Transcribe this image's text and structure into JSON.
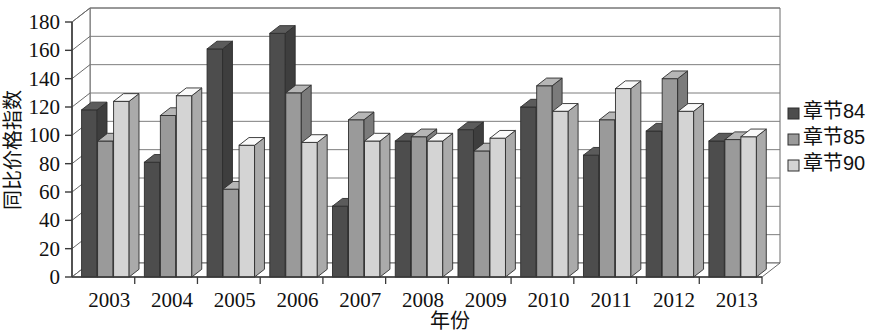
{
  "chart_data": {
    "type": "bar",
    "title": "",
    "subtitle": "",
    "xlabel": "年份",
    "ylabel": "同比价格指数",
    "categories": [
      "2003",
      "2004",
      "2005",
      "2006",
      "2007",
      "2008",
      "2009",
      "2010",
      "2011",
      "2012",
      "2013"
    ],
    "series": [
      {
        "name": "章节84",
        "color": "#4d4d4d",
        "values": [
          118,
          81,
          161,
          172,
          50,
          96,
          104,
          120,
          86,
          103,
          96
        ]
      },
      {
        "name": "章节85",
        "color": "#9a9a9a",
        "values": [
          96,
          114,
          62,
          130,
          111,
          99,
          89,
          135,
          111,
          140,
          97
        ]
      },
      {
        "name": "章节90",
        "color": "#d4d4d4",
        "values": [
          124,
          128,
          93,
          95,
          96,
          96,
          98,
          117,
          133,
          117,
          99
        ]
      }
    ],
    "ylim": [
      0,
      180
    ],
    "yticks": [
      0,
      20,
      40,
      60,
      80,
      100,
      120,
      140,
      160,
      180
    ],
    "ytick_labels": [
      "0",
      "20",
      "40",
      "60",
      "80",
      "100",
      "120",
      "140",
      "160",
      "180"
    ],
    "grid": true,
    "legend_position": "right",
    "style": "3d-clustered-column"
  },
  "legend": {
    "items": [
      {
        "label": "章节84",
        "swatch": "#4d4d4d"
      },
      {
        "label": "章节85",
        "swatch": "#9a9a9a"
      },
      {
        "label": "章节90",
        "swatch": "#d4d4d4"
      }
    ]
  },
  "axes": {
    "y_title": "同比价格指数",
    "x_title": "年份"
  }
}
